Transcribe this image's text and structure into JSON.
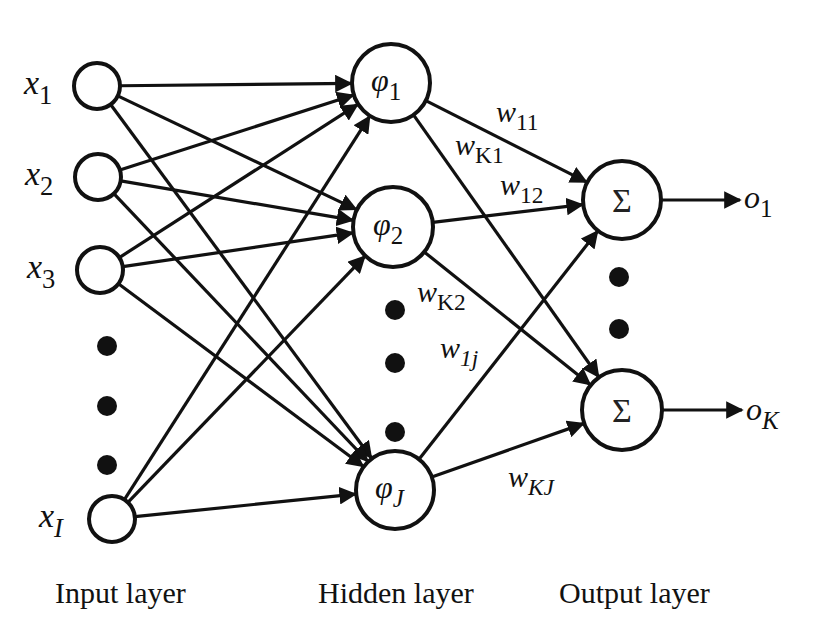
{
  "diagram": {
    "type": "neural-network (RBF network)",
    "colors": {
      "stroke": "#111111",
      "background": "#ffffff"
    },
    "input_layer": {
      "label": "Input layer",
      "nodes": [
        {
          "id": "x1",
          "var": "x",
          "sub": "1",
          "cx": 97,
          "cy": 86,
          "r": 23
        },
        {
          "id": "x2",
          "var": "x",
          "sub": "2",
          "cx": 98,
          "cy": 177,
          "r": 23
        },
        {
          "id": "x3",
          "var": "x",
          "sub": "3",
          "cx": 100,
          "cy": 270,
          "r": 23
        },
        {
          "id": "xI",
          "var": "x",
          "sub": "I",
          "cx": 112,
          "cy": 519,
          "r": 23
        }
      ],
      "ellipsis_dots": [
        {
          "cx": 107,
          "cy": 346
        },
        {
          "cx": 107,
          "cy": 406
        },
        {
          "cx": 107,
          "cy": 465
        }
      ]
    },
    "hidden_layer": {
      "label": "Hidden layer",
      "nodes": [
        {
          "id": "h1",
          "var": "φ",
          "sub": "1",
          "cx": 391,
          "cy": 83,
          "r": 39
        },
        {
          "id": "h2",
          "var": "φ",
          "sub": "2",
          "cx": 393,
          "cy": 227,
          "r": 40
        },
        {
          "id": "hJ",
          "var": "φ",
          "sub": "J",
          "cx": 395,
          "cy": 490,
          "r": 39
        }
      ],
      "ellipsis_dots": [
        {
          "cx": 395,
          "cy": 310
        },
        {
          "cx": 395,
          "cy": 363
        },
        {
          "cx": 395,
          "cy": 432
        }
      ]
    },
    "output_layer": {
      "label": "Output layer",
      "nodes": [
        {
          "id": "s1",
          "symbol": "Σ",
          "cx": 622,
          "cy": 200,
          "r": 39
        },
        {
          "id": "sK",
          "symbol": "Σ",
          "cx": 622,
          "cy": 410,
          "r": 40
        }
      ],
      "ellipsis_dots": [
        {
          "cx": 619,
          "cy": 277
        },
        {
          "cx": 619,
          "cy": 329
        }
      ],
      "outputs": [
        {
          "from": "s1",
          "var": "o",
          "sub": "1",
          "x_end": 740,
          "label_x": 744,
          "label_y": 208
        },
        {
          "from": "sK",
          "var": "o",
          "sub": "K",
          "x_end": 742,
          "label_x": 746,
          "label_y": 420
        }
      ]
    },
    "input_to_hidden_edges": [
      [
        "x1",
        "h1"
      ],
      [
        "x1",
        "h2"
      ],
      [
        "x1",
        "hJ"
      ],
      [
        "x2",
        "h1"
      ],
      [
        "x2",
        "h2"
      ],
      [
        "x2",
        "hJ"
      ],
      [
        "x3",
        "h1"
      ],
      [
        "x3",
        "h2"
      ],
      [
        "x3",
        "hJ"
      ],
      [
        "xI",
        "h1"
      ],
      [
        "xI",
        "h2"
      ],
      [
        "xI",
        "hJ"
      ]
    ],
    "hidden_to_output_edges": [
      [
        "h1",
        "s1"
      ],
      [
        "h1",
        "sK"
      ],
      [
        "h2",
        "s1"
      ],
      [
        "h2",
        "sK"
      ],
      [
        "hJ",
        "s1"
      ],
      [
        "hJ",
        "sK"
      ]
    ],
    "weight_labels": [
      {
        "var": "w",
        "sub": "11",
        "x": 496,
        "y": 122
      },
      {
        "var": "w",
        "sub": "K1",
        "x": 455,
        "y": 155
      },
      {
        "var": "w",
        "sub": "12",
        "x": 500,
        "y": 195
      },
      {
        "var": "w",
        "sub": "K2",
        "x": 417,
        "y": 302
      },
      {
        "var": "w",
        "sub": "1j",
        "x": 440,
        "y": 358
      },
      {
        "var": "w",
        "sub": "KJ",
        "x": 508,
        "y": 487
      }
    ],
    "layer_labels": [
      {
        "key": "input_layer",
        "text": "Input layer",
        "x": 55,
        "y": 603
      },
      {
        "key": "hidden_layer",
        "text": "Hidden layer",
        "x": 318,
        "y": 603
      },
      {
        "key": "output_layer",
        "text": "Output layer",
        "x": 559,
        "y": 603
      }
    ]
  }
}
